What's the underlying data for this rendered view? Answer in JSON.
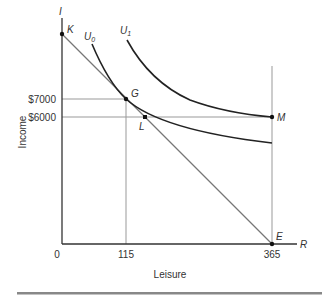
{
  "diagram": {
    "type": "indifference-curve budget-constraint",
    "axes": {
      "y_label": "Income",
      "y_axis_letter": "I",
      "x_label": "Leisure",
      "x_axis_letter": "R",
      "origin": "0"
    },
    "ticks": {
      "x": [
        "115",
        "365"
      ],
      "y": [
        "$7000",
        "$6000"
      ]
    },
    "points": {
      "K": "K",
      "G": "G",
      "L": "L",
      "M": "M",
      "E": "E"
    },
    "curves": {
      "u0": "U",
      "u0_sub": "0",
      "u1": "U",
      "u1_sub": "1"
    },
    "colors": {
      "axis": "#333333",
      "budget_line": "#777777",
      "guide_line": "#999999",
      "curve": "#222222",
      "footer_bar": "#888888"
    }
  }
}
